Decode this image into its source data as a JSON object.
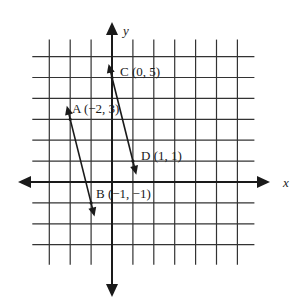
{
  "diagram": {
    "type": "coordinate-plane",
    "axes": {
      "x_label": "x",
      "y_label": "y",
      "x_range": [
        -3,
        6
      ],
      "y_range": [
        -3,
        6
      ]
    },
    "points": [
      {
        "id": "A",
        "label": "A (−2, 3)",
        "x": -2,
        "y": 3
      },
      {
        "id": "B",
        "label": "B (−1, −1)",
        "x": -1,
        "y": -1
      },
      {
        "id": "C",
        "label": "C (0, 5)",
        "x": 0,
        "y": 5
      },
      {
        "id": "D",
        "label": "D (1, 1)",
        "x": 1,
        "y": 1
      }
    ],
    "lines": [
      {
        "name": "line-AB",
        "through": [
          "A",
          "B"
        ]
      },
      {
        "name": "line-CD",
        "through": [
          "C",
          "D"
        ]
      }
    ],
    "colors": {
      "ink": "#1a1a1a",
      "grid": "#333333",
      "background": "#ffffff"
    }
  }
}
